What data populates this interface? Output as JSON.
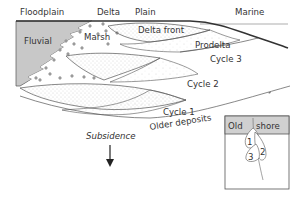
{
  "diagram": {
    "type": "geological-cross-section",
    "header_labels": {
      "floodplain": "Floodplain",
      "delta": "Delta",
      "plain": "Plain",
      "marine": "Marine"
    },
    "facies_labels": {
      "fluvial": "Fluvial",
      "marsh": "Marsh",
      "delta_front": "Delta front",
      "prodelta": "Prodelta"
    },
    "cycles": [
      {
        "label": "Cycle 3"
      },
      {
        "label": "Cycle 2"
      },
      {
        "label": "Cycle 1"
      }
    ],
    "older_deposits": "Older deposits",
    "subsidence": {
      "label": "Subsidence",
      "direction": "down"
    },
    "inset": {
      "left_label": "Old",
      "right_label": "shore",
      "lobe_numbers": [
        "1",
        "2",
        "3"
      ]
    },
    "colors": {
      "fluvial_fill": "#c8c8c8",
      "line": "#444444",
      "text": "#333333",
      "stipple": "#999999",
      "marsh_symbol": "#888888",
      "inset_header": "#d0d0d0"
    }
  }
}
